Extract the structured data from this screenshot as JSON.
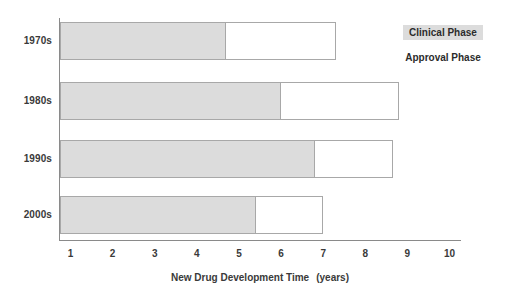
{
  "chart_data": {
    "type": "bar",
    "orientation": "horizontal",
    "stacked": true,
    "title": "",
    "xlabel": "New Drug Development Time",
    "xunit": "(years)",
    "ylabel": "",
    "xlim": [
      0.75,
      10.25
    ],
    "grid": false,
    "legend_position": "top-right",
    "categories": [
      "1970s",
      "1980s",
      "1990s",
      "2000s"
    ],
    "tick_labels": [
      "1",
      "2",
      "3",
      "4",
      "5",
      "6",
      "7",
      "8",
      "9",
      "10"
    ],
    "tick_values": [
      1,
      2,
      3,
      4,
      5,
      6,
      7,
      8,
      9,
      10
    ],
    "series": [
      {
        "name": "Clinical Phase",
        "color": "#dcdcdc",
        "values": [
          4.7,
          6.0,
          6.8,
          5.4
        ]
      },
      {
        "name": "Approval Phase",
        "color": "#ffffff",
        "values": [
          2.6,
          2.8,
          1.85,
          1.6
        ]
      }
    ],
    "totals": [
      7.3,
      8.8,
      8.65,
      7.0
    ],
    "segment_ends": {
      "clinical": [
        4.7,
        6.0,
        6.8,
        5.4
      ],
      "total": [
        7.3,
        8.8,
        8.65,
        7.0
      ]
    }
  },
  "legend": {
    "items": [
      {
        "label": "Clinical Phase",
        "style": "filled"
      },
      {
        "label": "Approval Phase",
        "style": "open"
      }
    ]
  },
  "axis": {
    "x_title": "New Drug Development Time",
    "x_unit": "(years)"
  }
}
